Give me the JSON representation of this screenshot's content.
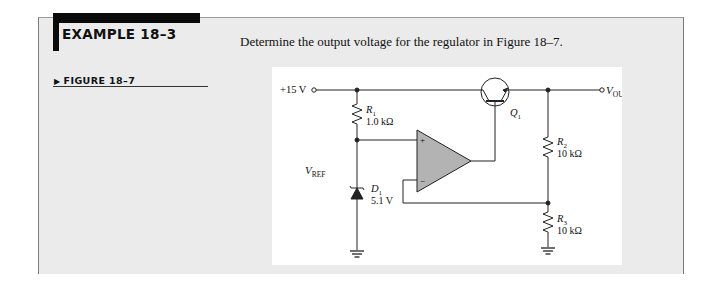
{
  "example": {
    "title": "EXAMPLE 18–3",
    "problem": "Determine the output voltage for the regulator in Figure 18–7."
  },
  "figure": {
    "label": "FIGURE 18–7",
    "arrow": "▶",
    "supply_label": "+15 V",
    "output_label_main": "V",
    "output_label_sub": "OUT",
    "vref_main": "V",
    "vref_sub": "REF",
    "components": {
      "R1": {
        "name": "R",
        "sub": "1",
        "value": "1.0 kΩ"
      },
      "R2": {
        "name": "R",
        "sub": "2",
        "value": "10 kΩ"
      },
      "R3": {
        "name": "R",
        "sub": "3",
        "value": "10 kΩ"
      },
      "D1": {
        "name": "D",
        "sub": "1",
        "value": "5.1 V"
      },
      "Q1": {
        "name": "Q",
        "sub": "1"
      },
      "opamp": {
        "plus": "+",
        "minus": "−"
      }
    }
  },
  "colors": {
    "panel_bg": "#ebebeb",
    "header_bar": "#0a0a0a",
    "opamp_fill": "#b3b3b3"
  }
}
